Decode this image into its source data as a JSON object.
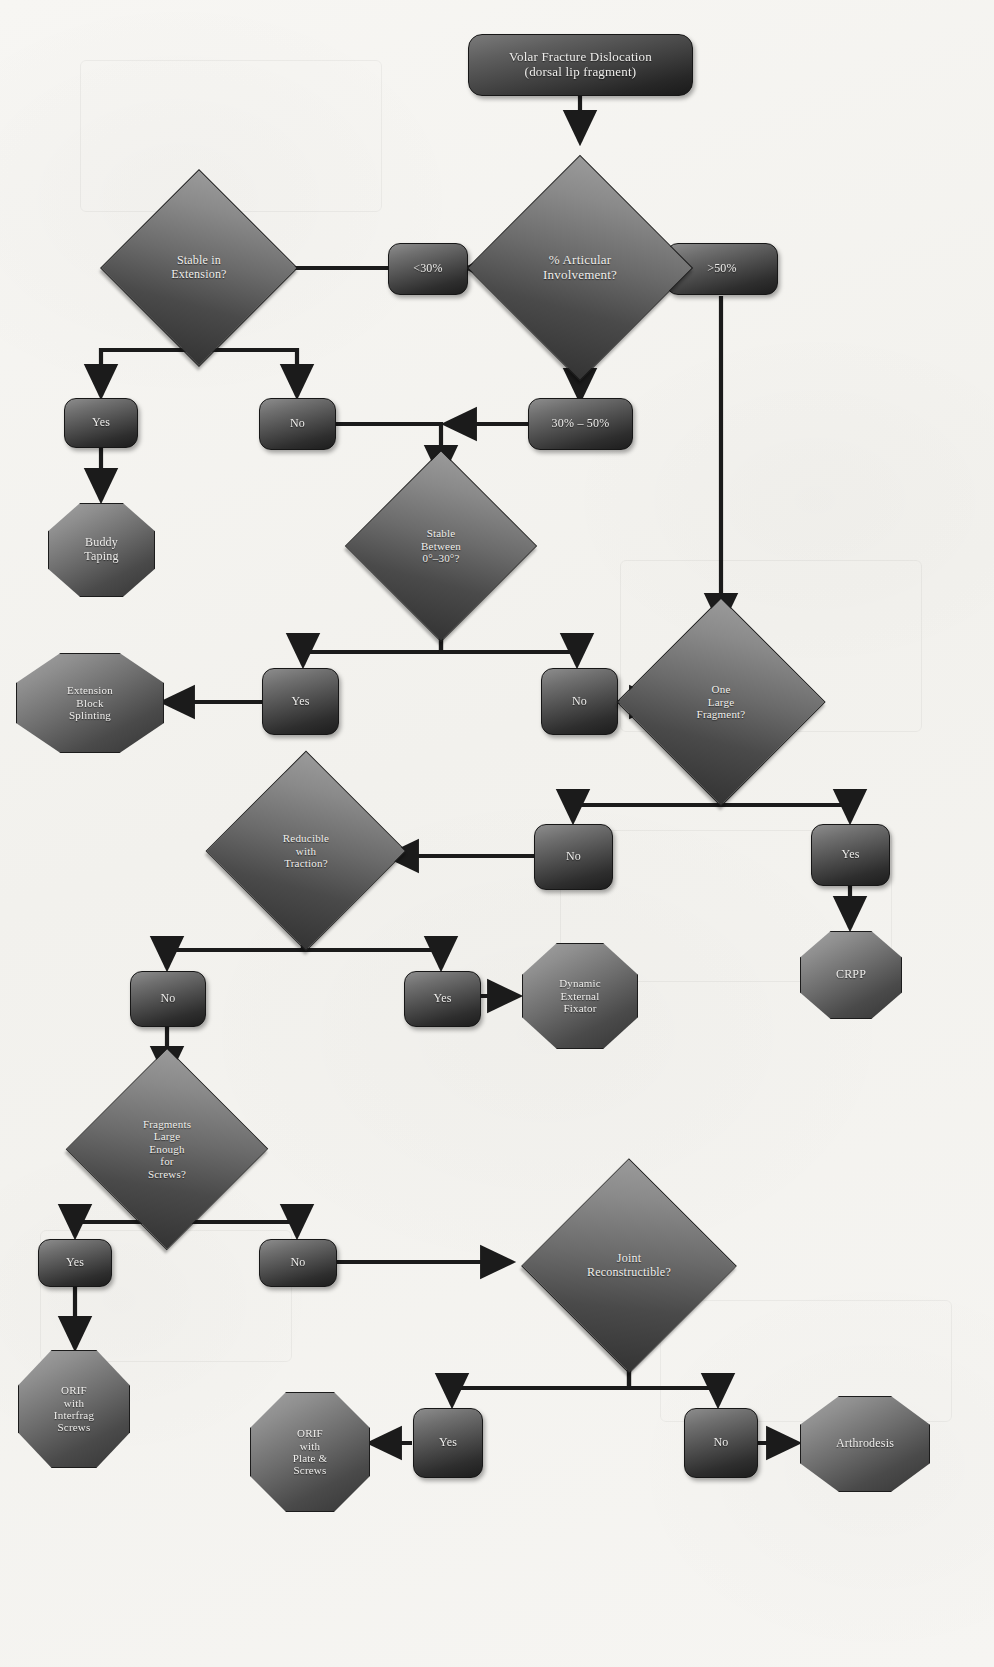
{
  "diagram": {
    "accent_color": "#2e2e2e",
    "node_text_color": "#efeeec",
    "background_color": "#f5f4f1"
  },
  "nodes": {
    "start": "Volar Fracture Dislocation\n(dorsal lip fragment)",
    "start_line1": "Volar Fracture Dislocation",
    "start_line2": "(dorsal lip fragment)",
    "q_articular": "% Articular\nInvolvement?",
    "q_articular_l1": "% Articular",
    "q_articular_l2": "Involvement?",
    "pct_lt30": "<30%",
    "pct_30_50": "30% – 50%",
    "pct_gt50": ">50%",
    "q_stable_ext_l1": "Stable in",
    "q_stable_ext_l2": "Extension?",
    "stable_ext_yes": "Yes",
    "stable_ext_no": "No",
    "buddy_taping_l1": "Buddy",
    "buddy_taping_l2": "Taping",
    "q_stable_between_l1": "Stable",
    "q_stable_between_l2": "Between",
    "q_stable_between_l3": "0°–30°?",
    "stable_between_yes": "Yes",
    "stable_between_no": "No",
    "ext_block_l1": "Extension",
    "ext_block_l2": "Block",
    "ext_block_l3": "Splinting",
    "q_one_large_l1": "One",
    "q_one_large_l2": "Large",
    "q_one_large_l3": "Fragment?",
    "one_large_no": "No",
    "one_large_yes": "Yes",
    "crpp": "CRPP",
    "q_reducible_l1": "Reducible",
    "q_reducible_l2": "with",
    "q_reducible_l3": "Traction?",
    "reducible_no": "No",
    "reducible_yes": "Yes",
    "dyn_fixator_l1": "Dynamic",
    "dyn_fixator_l2": "External",
    "dyn_fixator_l3": "Fixator",
    "q_fragments_l1": "Fragments",
    "q_fragments_l2": "Large",
    "q_fragments_l3": "Enough",
    "q_fragments_l4": "for",
    "q_fragments_l5": "Screws?",
    "fragments_yes": "Yes",
    "fragments_no": "No",
    "orif_interfrag_l1": "ORIF",
    "orif_interfrag_l2": "with",
    "orif_interfrag_l3": "Interfrag",
    "orif_interfrag_l4": "Screws",
    "q_joint_recon_l1": "Joint",
    "q_joint_recon_l2": "Reconstructible?",
    "joint_yes": "Yes",
    "joint_no": "No",
    "orif_plate_l1": "ORIF",
    "orif_plate_l2": "with",
    "orif_plate_l3": "Plate &",
    "orif_plate_l4": "Screws",
    "arthrodesis": "Arthrodesis"
  },
  "edges": [
    {
      "from": "start",
      "to": "q_articular",
      "label": ""
    },
    {
      "from": "q_articular",
      "to": "pct_lt30",
      "label": ""
    },
    {
      "from": "q_articular",
      "to": "pct_30_50",
      "label": ""
    },
    {
      "from": "q_articular",
      "to": "pct_gt50",
      "label": ""
    },
    {
      "from": "pct_lt30",
      "to": "q_stable_ext",
      "label": ""
    },
    {
      "from": "q_stable_ext",
      "to": "stable_ext_yes",
      "label": ""
    },
    {
      "from": "q_stable_ext",
      "to": "stable_ext_no",
      "label": ""
    },
    {
      "from": "stable_ext_yes",
      "to": "buddy_taping",
      "label": ""
    },
    {
      "from": "stable_ext_no",
      "to": "q_stable_between",
      "label": ""
    },
    {
      "from": "pct_30_50",
      "to": "q_stable_between",
      "label": ""
    },
    {
      "from": "q_stable_between",
      "to": "stable_between_yes",
      "label": ""
    },
    {
      "from": "q_stable_between",
      "to": "stable_between_no",
      "label": ""
    },
    {
      "from": "stable_between_yes",
      "to": "ext_block",
      "label": ""
    },
    {
      "from": "stable_between_no",
      "to": "q_one_large",
      "label": ""
    },
    {
      "from": "pct_gt50",
      "to": "q_one_large",
      "label": ""
    },
    {
      "from": "q_one_large",
      "to": "one_large_no",
      "label": ""
    },
    {
      "from": "q_one_large",
      "to": "one_large_yes",
      "label": ""
    },
    {
      "from": "one_large_yes",
      "to": "crpp",
      "label": ""
    },
    {
      "from": "one_large_no",
      "to": "q_reducible",
      "label": ""
    },
    {
      "from": "q_reducible",
      "to": "reducible_no",
      "label": ""
    },
    {
      "from": "q_reducible",
      "to": "reducible_yes",
      "label": ""
    },
    {
      "from": "reducible_yes",
      "to": "dyn_fixator",
      "label": ""
    },
    {
      "from": "reducible_no",
      "to": "q_fragments",
      "label": ""
    },
    {
      "from": "q_fragments",
      "to": "fragments_yes",
      "label": ""
    },
    {
      "from": "q_fragments",
      "to": "fragments_no",
      "label": ""
    },
    {
      "from": "fragments_yes",
      "to": "orif_interfrag",
      "label": ""
    },
    {
      "from": "fragments_no",
      "to": "q_joint_recon",
      "label": ""
    },
    {
      "from": "q_joint_recon",
      "to": "joint_yes",
      "label": ""
    },
    {
      "from": "q_joint_recon",
      "to": "joint_no",
      "label": ""
    },
    {
      "from": "joint_yes",
      "to": "orif_plate",
      "label": ""
    },
    {
      "from": "joint_no",
      "to": "arthrodesis",
      "label": ""
    }
  ]
}
